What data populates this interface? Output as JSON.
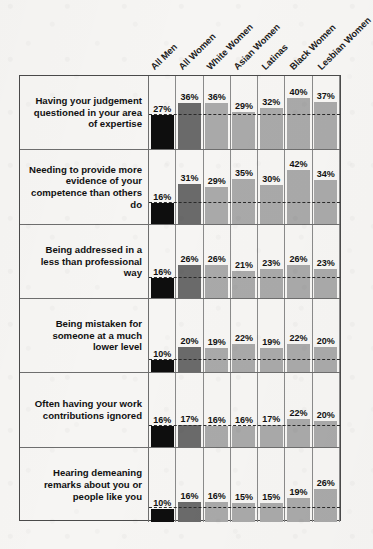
{
  "chart_data": {
    "type": "bar",
    "title": "",
    "subtitle": "",
    "xlabel": "",
    "ylabel": "",
    "ylim": [
      0,
      48
    ],
    "grid": false,
    "legend_position": "none",
    "orientation": "vertical",
    "units": "percent",
    "annotations": [
      "Dashed horizontal reference line marks the All Men value in each row"
    ],
    "categories": [
      "All Men",
      "All Women",
      "White Women",
      "Asian Women",
      "Latinas",
      "Black Women",
      "Lesbian Women"
    ],
    "series": [
      {
        "name": "Having your judgement questioned in your area of expertise",
        "values": [
          27,
          36,
          36,
          29,
          32,
          40,
          37
        ],
        "labels": [
          "27%",
          "36%",
          "36%",
          "29%",
          "32%",
          "40%",
          "37%"
        ]
      },
      {
        "name": "Needing to provide more evidence of your competence than others do",
        "values": [
          16,
          31,
          29,
          35,
          30,
          42,
          34
        ],
        "labels": [
          "16%",
          "31%",
          "29%",
          "35%",
          "30%",
          "42%",
          "34%"
        ]
      },
      {
        "name": "Being addressed in a less than professional way",
        "values": [
          16,
          26,
          26,
          21,
          23,
          26,
          23
        ],
        "labels": [
          "16%",
          "26%",
          "26%",
          "21%",
          "23%",
          "26%",
          "23%"
        ]
      },
      {
        "name": "Being mistaken for someone at a much lower level",
        "values": [
          10,
          20,
          19,
          22,
          19,
          22,
          20
        ],
        "labels": [
          "10%",
          "20%",
          "19%",
          "22%",
          "19%",
          "22%",
          "20%"
        ]
      },
      {
        "name": "Often having your work contributions ignored",
        "values": [
          16,
          17,
          16,
          16,
          17,
          22,
          20
        ],
        "labels": [
          "16%",
          "17%",
          "16%",
          "16%",
          "17%",
          "22%",
          "20%"
        ]
      },
      {
        "name": "Hearing demeaning remarks about you or people like you",
        "values": [
          10,
          16,
          16,
          15,
          15,
          19,
          26
        ],
        "labels": [
          "10%",
          "16%",
          "16%",
          "15%",
          "15%",
          "19%",
          "26%"
        ]
      }
    ],
    "colors": {
      "all_men_bar": "#0e0e0e",
      "all_women_bar": "#6a6a6a",
      "other_bars": "#a9a9a9",
      "reference_line": "#2a2a2a",
      "table_border": "#4a4a4a",
      "background": "#f6f5f3"
    }
  }
}
